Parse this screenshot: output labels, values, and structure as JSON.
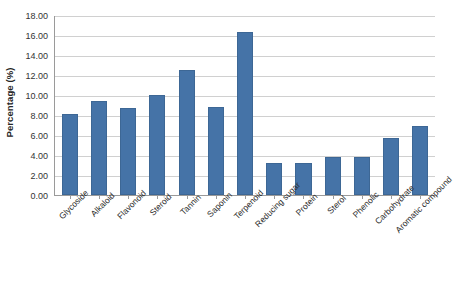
{
  "chart_data": {
    "type": "bar",
    "title": "",
    "xlabel": "",
    "ylabel": "Percentage (%)",
    "ylim": [
      0,
      18
    ],
    "ytick_step": 2,
    "grid": true,
    "legend": "none",
    "bar_color": "#4573A7",
    "gridline_color": "#D0D0D0",
    "categories": [
      "Glycoside",
      "Alkaloid",
      "Flavonoid",
      "Steroid",
      "Tannin",
      "Saponin",
      "Terpenoid",
      "Reducing sugar",
      "Protein",
      "Sterol",
      "Phenolic",
      "Carbohydrate",
      "Aromatic compound"
    ],
    "values": [
      8.1,
      9.4,
      8.7,
      10.0,
      12.5,
      8.8,
      16.3,
      3.2,
      3.2,
      3.8,
      3.8,
      5.7,
      6.9
    ],
    "ytick_labels": [
      "18.00",
      "16.00",
      "14.00",
      "12.00",
      "10.00",
      "8.00",
      "6.00",
      "4.00",
      "2.00",
      "0.00"
    ],
    "ytick_values": [
      18,
      16,
      14,
      12,
      10,
      8,
      6,
      4,
      2,
      0
    ]
  }
}
